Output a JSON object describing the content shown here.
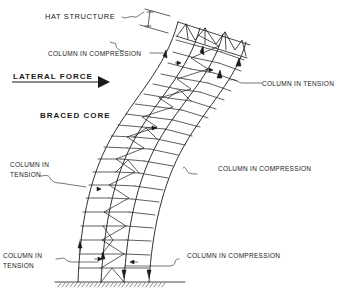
{
  "diagram": {
    "type": "structural-diagram",
    "labels": {
      "hat_structure": "HAT STRUCTURE",
      "column_compression_top": "COLUMN IN COMPRESSION",
      "lateral_force": "LATERAL FORCE",
      "column_tension_right": "COLUMN IN TENSION",
      "braced_core": "BRACED CORE",
      "column_tension_left": "COLUMN IN",
      "column_tension_left_2": "TENSION",
      "column_compression_right": "COLUMN IN COMPRESSION",
      "column_tension_bottom": "COLUMN IN",
      "column_tension_bottom_2": "TENSION",
      "column_compression_bottom": "COLUMN IN COMPRESSION"
    },
    "colors": {
      "ink": "#1a1a1a",
      "background": "#ffffff"
    }
  }
}
